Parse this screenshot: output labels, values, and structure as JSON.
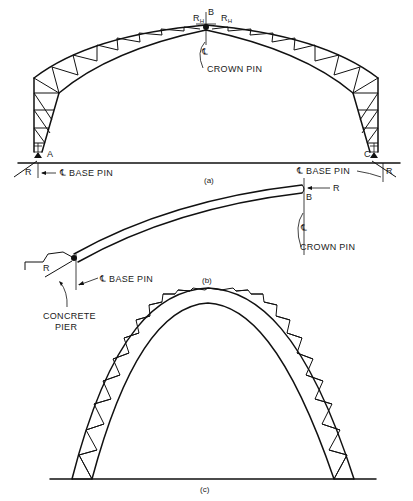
{
  "figure": {
    "panels": [
      {
        "id": "a",
        "caption": "(a)",
        "description": "Three-hinged trussed arch with rigid-frame legs",
        "labels": {
          "rh_left": "R",
          "rh_left_sub": "H",
          "crown_point": "B",
          "rh_right": "R",
          "rh_right_sub": "H",
          "centerline": "℄",
          "crown_pin": "CROWN PIN",
          "point_a": "A",
          "point_c": "C",
          "reaction_left": "R",
          "reaction_right": "R",
          "base_pin_left": "℄ BASE PIN",
          "base_pin_right": "℄ BASE PIN"
        }
      },
      {
        "id": "b",
        "caption": "(b)",
        "description": "Half arch rib on concrete pier",
        "labels": {
          "reaction_crown": "R",
          "crown_point": "B",
          "centerline": "℄",
          "crown_pin": "CROWN PIN",
          "reaction_base": "R",
          "base_pin": "℄ BASE PIN",
          "concrete_pier_line1": "CONCRETE",
          "concrete_pier_line2": "PIER"
        }
      },
      {
        "id": "c",
        "caption": "(c)",
        "description": "Parabolic trussed arch"
      }
    ]
  }
}
